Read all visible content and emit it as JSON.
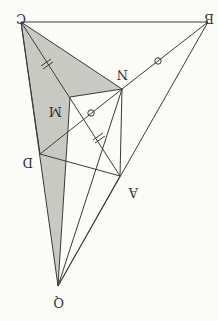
{
  "diagram": {
    "rotation": 180,
    "points": {
      "C": {
        "label": "C",
        "x": 21,
        "y": 22
      },
      "B": {
        "label": "B",
        "x": 208,
        "y": 22
      },
      "N": {
        "label": "N",
        "x": 122,
        "y": 89
      },
      "M": {
        "label": "M",
        "x": 70,
        "y": 97
      },
      "D": {
        "label": "D",
        "x": 40,
        "y": 154
      },
      "A": {
        "label": "A",
        "x": 120,
        "y": 176
      },
      "Q": {
        "label": "Q",
        "x": 58,
        "y": 286
      }
    },
    "segments": [
      [
        "C",
        "B"
      ],
      [
        "B",
        "N"
      ],
      [
        "N",
        "C"
      ],
      [
        "C",
        "M"
      ],
      [
        "M",
        "N"
      ],
      [
        "C",
        "D"
      ],
      [
        "D",
        "N"
      ],
      [
        "D",
        "A"
      ],
      [
        "N",
        "A"
      ],
      [
        "C",
        "A"
      ],
      [
        "M",
        "A"
      ],
      [
        "B",
        "Q"
      ],
      [
        "C",
        "Q"
      ],
      [
        "N",
        "Q"
      ],
      [
        "A",
        "Q"
      ],
      [
        "M",
        "Q"
      ]
    ],
    "shaded_regions": [
      [
        "C",
        "N",
        "M"
      ],
      [
        "C",
        "M",
        "Q"
      ]
    ],
    "marks": {
      "circle_marks": [
        "BN midpoint",
        "DN midpoint"
      ],
      "double_tick_marks": [
        "CM",
        "MA"
      ]
    },
    "colors": {
      "line": "#3a3a3a",
      "shade": "#c9c9c4",
      "background": "#fbfbf7"
    }
  }
}
